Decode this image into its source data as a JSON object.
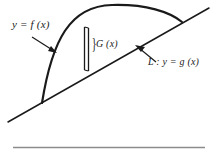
{
  "figure": {
    "labels": {
      "curve": "y = f (x)",
      "strip": "G (x)",
      "line": "L : y = g (x)",
      "brace": "}"
    },
    "colors": {
      "ink": "#1a1a1a",
      "rule": "#8c8c8c",
      "background": "#ffffff"
    },
    "geometry": {
      "curve": {
        "start": [
          42,
          103
        ],
        "control1": [
          60,
          4
        ],
        "control2": [
          150,
          2
        ],
        "end": [
          182,
          22
        ]
      },
      "line": {
        "start": [
          8,
          122
        ],
        "end": [
          209,
          8
        ]
      },
      "strip": {
        "left_x": 84,
        "right_x": 88,
        "top_y": 27,
        "bottom_y": 70
      },
      "arrow_curve": {
        "from": [
          32,
          37
        ],
        "to": [
          56,
          53
        ]
      },
      "arrow_line": {
        "from": [
          156,
          62
        ],
        "to": [
          136,
          46
        ]
      },
      "rule": {
        "x1": 13,
        "x2": 205,
        "y": 147
      }
    }
  }
}
